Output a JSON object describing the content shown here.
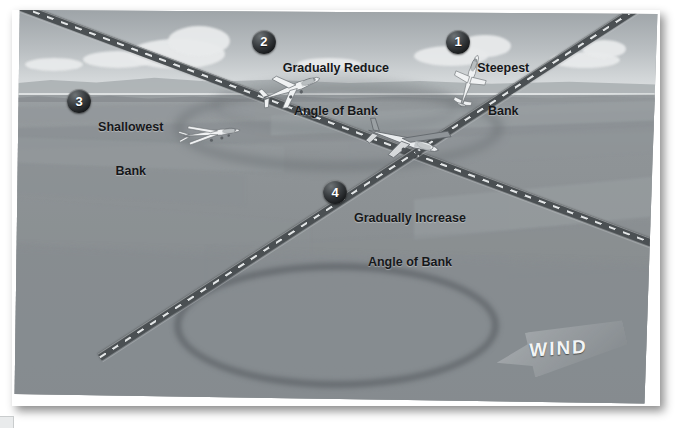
{
  "figure": {
    "wind": {
      "label": "WIND",
      "direction": "from the right, blowing toward upper-left"
    },
    "background_colors": {
      "sky_top": "#9ea4a8",
      "sky_bottom": "#dfe2e3",
      "ground": "#8f9497",
      "road": "#4b5053",
      "road_dash": "#e3e6e7",
      "badge_dark": "#17191b",
      "text": "#16181a"
    },
    "callouts": [
      {
        "number": "1",
        "line1": "Steepest",
        "line2": "Bank",
        "align": "center"
      },
      {
        "number": "2",
        "line1": "Gradually Reduce",
        "line2": "Angle of Bank",
        "align": "center"
      },
      {
        "number": "3",
        "line1": "Shallowest",
        "line2": "Bank",
        "align": "center"
      },
      {
        "number": "4",
        "line1": "Gradually Increase",
        "line2": "Angle of Bank",
        "align": "center"
      }
    ],
    "aircraft": [
      {
        "id": "1",
        "bank_state": "steepest-bank",
        "bank_degrees": 72
      },
      {
        "id": "2",
        "bank_state": "reducing-bank",
        "bank_degrees": 26
      },
      {
        "id": "3",
        "bank_state": "shallowest-bank",
        "bank_degrees": 6
      },
      {
        "id": "4",
        "bank_state": "increasing-bank",
        "bank_degrees": 40
      }
    ],
    "scene_elements": [
      "sky-gradient",
      "clouds",
      "distant-ridge",
      "tree-line",
      "farm-fields",
      "crossing-roads",
      "ground-track-ellipse",
      "wind-arrow"
    ]
  }
}
